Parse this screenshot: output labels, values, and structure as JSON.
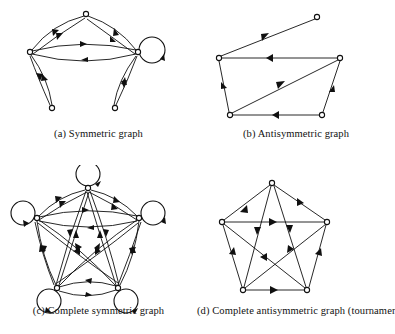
{
  "figure": {
    "background_color": "#ffffff",
    "ink_color": "#101010",
    "panels": [
      {
        "key": "a",
        "caption": "(a) Symmetric graph",
        "graph_type": "symmetric",
        "node_count": 5,
        "has_self_loops": true,
        "self_loop_count": 1,
        "edge_style": "curved double arcs in both directions"
      },
      {
        "key": "b",
        "caption": "(b) Antisymmetric graph",
        "graph_type": "antisymmetric",
        "node_count": 5,
        "has_self_loops": false,
        "self_loop_count": 0,
        "edge_style": "straight single-direction arcs"
      },
      {
        "key": "c",
        "caption": "(c) Complete symmetric graph",
        "graph_type": "complete-symmetric",
        "node_count": 5,
        "has_self_loops": true,
        "self_loop_count": 5,
        "edge_style": "curved double arcs between every pair plus self loops"
      },
      {
        "key": "d",
        "caption": "(d) Complete antisymmetric graph (tournament)",
        "graph_type": "tournament",
        "node_count": 5,
        "has_self_loops": false,
        "self_loop_count": 0,
        "edge_style": "straight single-direction arcs between every pair"
      }
    ]
  }
}
